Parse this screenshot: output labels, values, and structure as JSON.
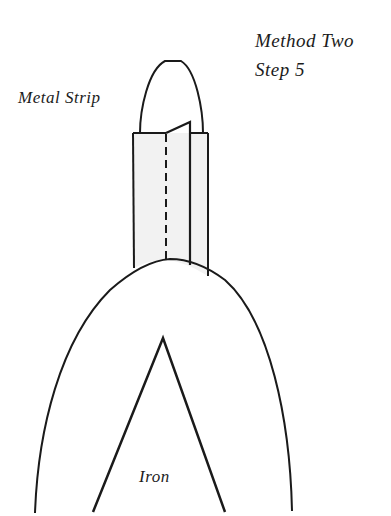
{
  "title": {
    "line1": "Method  Two",
    "line2": "Step  5"
  },
  "labels": {
    "metal_strip": "Metal Strip",
    "iron": "Iron"
  },
  "colors": {
    "stroke": "#1a1a1a",
    "strip_fill": "#f2f2f2",
    "background": "#ffffff"
  }
}
